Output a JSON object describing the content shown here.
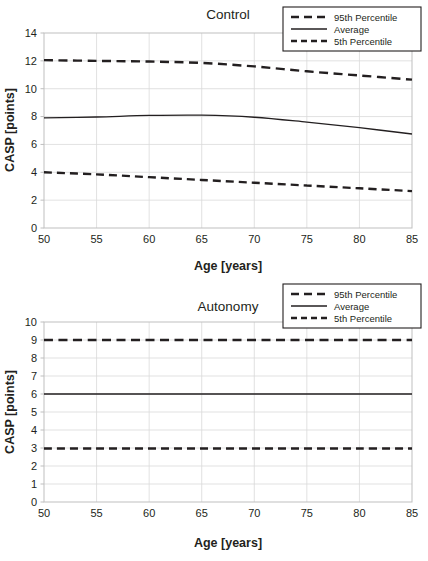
{
  "chart_data": [
    {
      "type": "line",
      "title": "Control",
      "xlabel": "Age [years]",
      "ylabel": "CASP [points]",
      "xlim": [
        50,
        85
      ],
      "ylim": [
        0,
        14
      ],
      "xticks": [
        50,
        55,
        60,
        65,
        70,
        75,
        80,
        85
      ],
      "yticks": [
        0,
        2,
        4,
        6,
        8,
        10,
        12,
        14
      ],
      "grid": true,
      "legend_position": "top-right",
      "x": [
        50,
        55,
        60,
        65,
        70,
        75,
        80,
        85
      ],
      "series": [
        {
          "name": "95th Percentile",
          "style": "dashed",
          "values": [
            12.05,
            12.0,
            11.95,
            11.85,
            11.6,
            11.25,
            10.95,
            10.65
          ]
        },
        {
          "name": "Average",
          "style": "solid",
          "values": [
            7.9,
            7.97,
            8.08,
            8.1,
            7.95,
            7.6,
            7.2,
            6.75
          ]
        },
        {
          "name": "5th Percentile",
          "style": "dashed",
          "values": [
            4.0,
            3.85,
            3.65,
            3.45,
            3.25,
            3.05,
            2.85,
            2.65
          ]
        }
      ]
    },
    {
      "type": "line",
      "title": "Autonomy",
      "xlabel": "Age [years]",
      "ylabel": "CASP [points]",
      "xlim": [
        50,
        85
      ],
      "ylim": [
        0,
        10
      ],
      "xticks": [
        50,
        55,
        60,
        65,
        70,
        75,
        80,
        85
      ],
      "yticks": [
        0,
        1,
        2,
        3,
        4,
        5,
        6,
        7,
        8,
        9,
        10
      ],
      "grid": true,
      "legend_position": "top-right",
      "x": [
        50,
        55,
        60,
        65,
        70,
        75,
        80,
        85
      ],
      "series": [
        {
          "name": "95th Percentile",
          "style": "dashed",
          "values": [
            9.0,
            9.0,
            9.0,
            9.0,
            9.0,
            9.0,
            9.0,
            9.0
          ]
        },
        {
          "name": "Average",
          "style": "solid",
          "values": [
            6.0,
            6.0,
            6.0,
            6.0,
            6.0,
            6.0,
            6.0,
            6.0
          ]
        },
        {
          "name": "5th Percentile",
          "style": "dashed",
          "values": [
            2.97,
            2.97,
            2.97,
            2.97,
            2.97,
            2.97,
            2.97,
            2.97
          ]
        }
      ]
    }
  ],
  "charts": {
    "control": {
      "title": "Control",
      "xlabel": "Age [years]",
      "ylabel": "CASP [points]",
      "xticks": [
        "50",
        "55",
        "60",
        "65",
        "70",
        "75",
        "80",
        "85"
      ],
      "yticks": [
        "14",
        "12",
        "10",
        "8",
        "6",
        "4",
        "2",
        "0"
      ],
      "legend": [
        "95th Percentile",
        "Average",
        "5th Percentile"
      ]
    },
    "autonomy": {
      "title": "Autonomy",
      "xlabel": "Age [years]",
      "ylabel": "CASP [points]",
      "xticks": [
        "50",
        "55",
        "60",
        "65",
        "70",
        "75",
        "80",
        "85"
      ],
      "yticks": [
        "10",
        "9",
        "8",
        "7",
        "6",
        "5",
        "4",
        "3",
        "2",
        "1",
        "0"
      ],
      "legend": [
        "95th Percentile",
        "Average",
        "5th Percentile"
      ]
    }
  },
  "colors": {
    "ink": "#231f20",
    "grid": "#d9d9d9",
    "frame": "#bfbfbf",
    "background": "#ffffff"
  }
}
